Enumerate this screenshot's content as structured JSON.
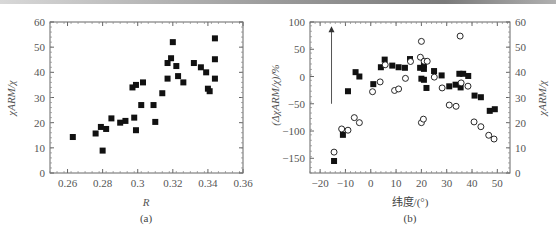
{
  "figure": {
    "top_rule_color": "#8a8a8a"
  },
  "chart_data": [
    {
      "id": "a",
      "type": "scatter",
      "caption": "(a)",
      "title": "",
      "xlabel": "R",
      "ylabel": "χARM/χ",
      "xlim": [
        0.25,
        0.36
      ],
      "ylim": [
        0,
        60
      ],
      "xticks": [
        0.26,
        0.28,
        0.3,
        0.32,
        0.34,
        0.36
      ],
      "xtick_labels": [
        "0.26",
        "0.28",
        "0.3",
        "0.32",
        "0.34",
        "0.36"
      ],
      "yticks": [
        0,
        10,
        20,
        30,
        40,
        50,
        60
      ],
      "ytick_labels": [
        "0",
        "10",
        "20",
        "30",
        "40",
        "50",
        "60"
      ],
      "grid": false,
      "legend": null,
      "series": [
        {
          "name": "samples",
          "marker": "filled-square",
          "color": "#111111",
          "points": [
            [
              0.263,
              14.3
            ],
            [
              0.276,
              15.7
            ],
            [
              0.279,
              18.3
            ],
            [
              0.28,
              8.9
            ],
            [
              0.282,
              17.5
            ],
            [
              0.285,
              21.7
            ],
            [
              0.29,
              20.0
            ],
            [
              0.293,
              20.7
            ],
            [
              0.297,
              34.0
            ],
            [
              0.299,
              35.0
            ],
            [
              0.298,
              22.0
            ],
            [
              0.299,
              17.0
            ],
            [
              0.302,
              27.0
            ],
            [
              0.303,
              36.0
            ],
            [
              0.309,
              27.0
            ],
            [
              0.31,
              20.3
            ],
            [
              0.314,
              31.7
            ],
            [
              0.317,
              37.5
            ],
            [
              0.317,
              43.7
            ],
            [
              0.319,
              45.6
            ],
            [
              0.32,
              52.0
            ],
            [
              0.322,
              42.5
            ],
            [
              0.323,
              38.5
            ],
            [
              0.326,
              36.0
            ],
            [
              0.332,
              43.7
            ],
            [
              0.336,
              42.0
            ],
            [
              0.339,
              40.0
            ],
            [
              0.34,
              33.5
            ],
            [
              0.341,
              32.5
            ],
            [
              0.344,
              53.5
            ],
            [
              0.344,
              45.2
            ],
            [
              0.344,
              37.5
            ]
          ]
        }
      ]
    },
    {
      "id": "b",
      "type": "scatter",
      "caption": "(b)",
      "title": "",
      "xlabel": "纬度/(°)",
      "ylabel": "(ΔχARM/χ)/%",
      "ylabel_right": "χARM/χ",
      "xlim": [
        -24,
        55
      ],
      "ylim": [
        -177,
        100
      ],
      "ylim_right": [
        0,
        60
      ],
      "xticks": [
        -20,
        -10,
        0,
        10,
        20,
        30,
        40,
        50
      ],
      "xtick_labels": [
        "−20",
        "−10",
        "0",
        "10",
        "20",
        "30",
        "40",
        "50"
      ],
      "yticks": [
        100,
        50,
        0,
        -50,
        -100,
        -150
      ],
      "ytick_labels": [
        "100",
        "50",
        "0",
        "−50",
        "−100",
        "−150"
      ],
      "yticks_right": [
        0,
        10,
        20,
        30,
        40,
        50,
        60
      ],
      "ytick_labels_right": [
        "0",
        "10",
        "20",
        "30",
        "40",
        "50",
        "60"
      ],
      "grid": false,
      "legend": null,
      "annotations": [
        {
          "type": "arrow",
          "x": -15.5,
          "y_from": -50,
          "y_to": 92
        }
      ],
      "series": [
        {
          "name": "(ΔχARM/χ)/%",
          "axis": "left",
          "marker": "filled-square",
          "color": "#111111",
          "points": [
            [
              -14.5,
              -155
            ],
            [
              -11,
              -107
            ],
            [
              -9,
              -27
            ],
            [
              -6,
              8
            ],
            [
              -4.5,
              0
            ],
            [
              1,
              -14
            ],
            [
              4,
              17
            ],
            [
              5.5,
              31
            ],
            [
              8.5,
              20
            ],
            [
              11,
              17
            ],
            [
              13.5,
              16
            ],
            [
              15.5,
              32
            ],
            [
              19.5,
              16
            ],
            [
              21,
              21
            ],
            [
              21,
              14
            ],
            [
              20,
              -4
            ],
            [
              21,
              -6
            ],
            [
              22,
              -21
            ],
            [
              25,
              10
            ],
            [
              28,
              2
            ],
            [
              31,
              -18
            ],
            [
              33.5,
              -15
            ],
            [
              35,
              5
            ],
            [
              36.5,
              5
            ],
            [
              35.5,
              -20
            ],
            [
              38.5,
              1
            ],
            [
              41,
              -35
            ],
            [
              43.5,
              -38
            ],
            [
              47,
              -63
            ],
            [
              49,
              -60
            ]
          ]
        },
        {
          "name": "χARM/χ",
          "axis": "right",
          "marker": "open-circle",
          "color": "#111111",
          "points": [
            [
              -14.5,
              8.3
            ],
            [
              -11.5,
              17.5
            ],
            [
              -9,
              17
            ],
            [
              -6.5,
              22
            ],
            [
              -4.5,
              20
            ],
            [
              0.7,
              32.3
            ],
            [
              3.7,
              36.2
            ],
            [
              5.7,
              43
            ],
            [
              9.4,
              32.8
            ],
            [
              11,
              33.4
            ],
            [
              13.7,
              37.6
            ],
            [
              15.7,
              44.3
            ],
            [
              20,
              52.3
            ],
            [
              19.6,
              46
            ],
            [
              21.1,
              44.4
            ],
            [
              22.3,
              44.4
            ],
            [
              20,
              20
            ],
            [
              20.8,
              21.4
            ],
            [
              25.1,
              38.1
            ],
            [
              28.2,
              33.8
            ],
            [
              31,
              27
            ],
            [
              33.7,
              26.5
            ],
            [
              35.3,
              54.4
            ],
            [
              35.7,
              35.8
            ],
            [
              38.4,
              34.5
            ],
            [
              40.8,
              20.3
            ],
            [
              43.5,
              18.4
            ],
            [
              46.6,
              15
            ],
            [
              48.7,
              13.5
            ]
          ]
        }
      ]
    }
  ]
}
